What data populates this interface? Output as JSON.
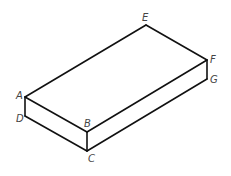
{
  "diagram": {
    "type": "isometric-rectangular-prism",
    "stroke_color": "#111111",
    "label_color": "#444444",
    "vertices": {
      "A": {
        "label": "A",
        "x": 25,
        "y": 97
      },
      "B": {
        "label": "B",
        "x": 87,
        "y": 132
      },
      "C": {
        "label": "C",
        "x": 87,
        "y": 151
      },
      "D": {
        "label": "D",
        "x": 25,
        "y": 116
      },
      "E": {
        "label": "E",
        "x": 146,
        "y": 25
      },
      "F": {
        "label": "F",
        "x": 207,
        "y": 60
      },
      "G": {
        "label": "G",
        "x": 207,
        "y": 79
      }
    },
    "edges": [
      [
        "A",
        "E"
      ],
      [
        "E",
        "F"
      ],
      [
        "A",
        "B"
      ],
      [
        "B",
        "F"
      ],
      [
        "A",
        "D"
      ],
      [
        "D",
        "C"
      ],
      [
        "B",
        "C"
      ],
      [
        "C",
        "G"
      ],
      [
        "F",
        "G"
      ]
    ],
    "labels": {
      "A": "A",
      "B": "B",
      "C": "C",
      "D": "D",
      "E": "E",
      "F": "F",
      "G": "G"
    }
  }
}
